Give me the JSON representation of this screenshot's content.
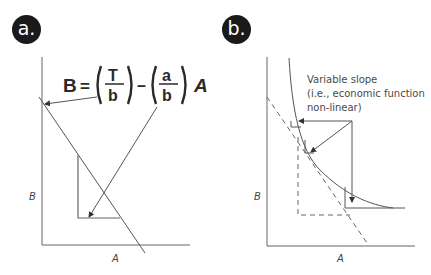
{
  "panels": [
    {
      "id": "a",
      "badge": "a.",
      "equation": {
        "lhs": "B",
        "eq": "=",
        "frac1_num": "T",
        "frac1_den": "b",
        "minus": "–",
        "frac2_num": "a",
        "frac2_den": "b",
        "var": "A"
      },
      "x_label": "A",
      "y_label": "B"
    },
    {
      "id": "b",
      "badge": "b.",
      "annotation": [
        "Variable slope",
        "(i.e., economic function",
        "non-linear)"
      ],
      "x_label": "A",
      "y_label": "B"
    }
  ],
  "colors": {
    "line": "#555555",
    "badge_bg": "#1a1a1a",
    "badge_fg": "#ffffff"
  }
}
